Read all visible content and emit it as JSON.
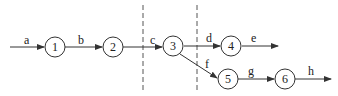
{
  "diagram": {
    "type": "flow-graph",
    "nodes": [
      {
        "id": "1",
        "label": "1",
        "cx": 55,
        "cy": 47
      },
      {
        "id": "2",
        "label": "2",
        "cx": 113,
        "cy": 47
      },
      {
        "id": "3",
        "label": "3",
        "cx": 173,
        "cy": 46
      },
      {
        "id": "4",
        "label": "4",
        "cx": 231,
        "cy": 46
      },
      {
        "id": "5",
        "label": "5",
        "cx": 228,
        "cy": 79
      },
      {
        "id": "6",
        "label": "6",
        "cx": 285,
        "cy": 79
      }
    ],
    "edges": [
      {
        "label": "a",
        "from": "start",
        "to": "1"
      },
      {
        "label": "b",
        "from": "1",
        "to": "2"
      },
      {
        "label": "c",
        "from": "2",
        "to": "3"
      },
      {
        "label": "d",
        "from": "3",
        "to": "4"
      },
      {
        "label": "e",
        "from": "4",
        "to": "end"
      },
      {
        "label": "f",
        "from": "3",
        "to": "5"
      },
      {
        "label": "g",
        "from": "5",
        "to": "6"
      },
      {
        "label": "h",
        "from": "6",
        "to": "end"
      }
    ],
    "cut_lines": [
      {
        "x": 143,
        "style": "dashed"
      },
      {
        "x": 197,
        "style": "dashed"
      }
    ],
    "colors": {
      "stroke": "#333333",
      "dash": "#555555",
      "background": "#ffffff"
    }
  }
}
